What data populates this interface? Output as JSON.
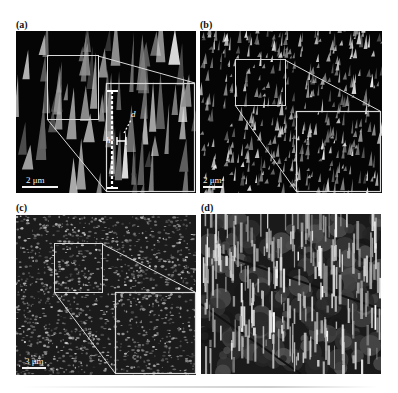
{
  "figure": {
    "panels": [
      {
        "id": "a",
        "label": "(a)",
        "scale_bar": "2 μm",
        "texture": "sparse-spikes",
        "annotations": {
          "height_label": "h",
          "diameter_label": "d"
        }
      },
      {
        "id": "b",
        "label": "(b)",
        "scale_bar": "2 μm",
        "texture": "dense-small-spikes"
      },
      {
        "id": "c",
        "label": "(c)",
        "scale_bar": "3 μm",
        "texture": "granular"
      },
      {
        "id": "d",
        "label": "(d)",
        "scale_bar": "",
        "texture": "tall-pillars"
      }
    ],
    "colors": {
      "frame": "#d9d9d9",
      "background": "#050505",
      "feature": "#e8e8e8"
    }
  }
}
